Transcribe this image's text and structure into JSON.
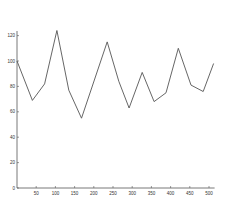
{
  "chart_data": {
    "type": "line",
    "title": "",
    "xlabel": "",
    "ylabel": "",
    "xlim": [
      0,
      512
    ],
    "ylim": [
      0,
      130
    ],
    "grid": false,
    "legend": null,
    "x_ticks": [
      50,
      100,
      150,
      200,
      250,
      300,
      350,
      400,
      450,
      500
    ],
    "y_ticks": [
      0,
      20,
      40,
      60,
      80,
      100,
      120
    ],
    "series": [
      {
        "name": "series-1",
        "color": "#555555",
        "x": [
          0,
          40,
          72,
          104,
          135,
          168,
          235,
          265,
          292,
          326,
          357,
          388,
          420,
          453,
          485,
          512
        ],
        "values": [
          100,
          69,
          82,
          124,
          77,
          55,
          115,
          84,
          63,
          91,
          68,
          75,
          110,
          81,
          76,
          98
        ]
      }
    ]
  }
}
